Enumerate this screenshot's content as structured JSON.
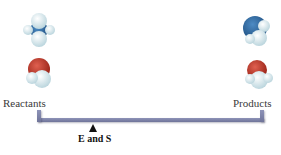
{
  "labels": {
    "left": "Reactants",
    "right": "Products",
    "fulcrum": "E and S"
  },
  "molecules": {
    "reactants": [
      "nitrogen-hydrogen-molecule",
      "oxygen-hydrogen-molecule"
    ],
    "products": [
      "nitrogen-hydrogen-molecule",
      "oxygen-hydrogen-molecule"
    ]
  },
  "colors": {
    "nitrogen": "#2f6aa3",
    "oxygen": "#c0392b",
    "hydrogen": "#dfeef2",
    "bar": "#7a7fa6"
  }
}
